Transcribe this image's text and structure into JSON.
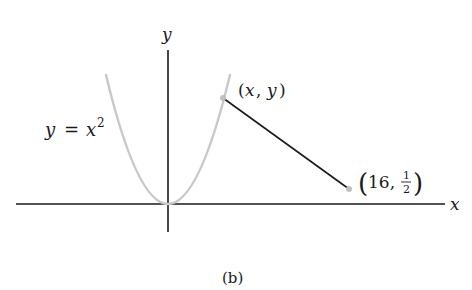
{
  "figure": {
    "caption": "(b)",
    "axes": {
      "x_label": "x",
      "y_label": "y",
      "axis_color": "#1a1a1a"
    },
    "curve": {
      "label_lhs": "y",
      "label_eq": "=",
      "label_var": "x",
      "label_exp": "2",
      "equation": "y = x^2",
      "color": "#c8c8c8"
    },
    "points": [
      {
        "name": "point-on-curve",
        "label_open": "(",
        "label_x": "x",
        "label_sep": ",",
        "label_y": "y",
        "label_close": ")",
        "label": "(x, y)",
        "color": "#c0c0c0"
      },
      {
        "name": "fixed-point",
        "label_open": "(",
        "label_x": "16,",
        "frac_num": "1",
        "frac_den": "2",
        "label_close": ")",
        "label": "(16, 1/2)",
        "color": "#c0c0c0"
      }
    ],
    "segment": {
      "from": "(x, y)",
      "to": "(16, 1/2)",
      "color": "#1a1a1a"
    }
  }
}
